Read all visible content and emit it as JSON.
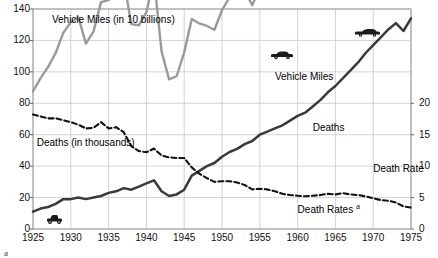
{
  "chart_data": {
    "type": "line",
    "title": "",
    "xlabel": "",
    "ylabel_left": "Deaths (in thousands)",
    "ylabel_right": "",
    "xlim": [
      1925,
      1975
    ],
    "ylim_left": [
      0,
      140
    ],
    "ylim_right": [
      0,
      20
    ],
    "grid": true,
    "legend_position": "inline-annotations",
    "x_ticks": [
      "1925",
      "1930",
      "1935",
      "1940",
      "1945",
      "1950",
      "1955",
      "1960",
      "1965",
      "1970",
      "1975"
    ],
    "y_ticks_left": [
      "0",
      "20",
      "40",
      "60",
      "80",
      "100",
      "120",
      "140"
    ],
    "y_ticks_right": [
      "0",
      "5",
      "10",
      "15",
      "20"
    ],
    "annotations": [
      {
        "text": "Vehicle Miles (in 10 billions)",
        "x": 1927.5,
        "y_left": 133
      },
      {
        "text": "Deaths (in thousands)",
        "x": 1925.5,
        "y_left": 55
      },
      {
        "text": "Vehicle Miles",
        "x": 1957,
        "y_left": 97
      },
      {
        "text": "Deaths",
        "x": 1962,
        "y_left": 64
      },
      {
        "text": "Death Rate",
        "x": 1970,
        "y_left": 38
      },
      {
        "text": "Death Rates",
        "x": 1960,
        "y_left": 14,
        "superscript": "a"
      }
    ],
    "icons": [
      {
        "name": "vintage-car-icon",
        "x": 1928,
        "y_left": 8
      },
      {
        "name": "sedan-car-icon",
        "x": 1958,
        "y_left": 113
      },
      {
        "name": "modern-car-icon",
        "x": 1969,
        "y_left": 127
      }
    ],
    "x": [
      1925,
      1926,
      1927,
      1928,
      1929,
      1930,
      1931,
      1932,
      1933,
      1934,
      1935,
      1936,
      1937,
      1938,
      1939,
      1940,
      1941,
      1942,
      1943,
      1944,
      1945,
      1946,
      1947,
      1948,
      1949,
      1950,
      1951,
      1952,
      1953,
      1954,
      1955,
      1956,
      1957,
      1958,
      1959,
      1960,
      1961,
      1962,
      1963,
      1964,
      1965,
      1966,
      1967,
      1968,
      1969,
      1970,
      1971,
      1972,
      1973,
      1974,
      1975
    ],
    "series": [
      {
        "name": "Vehicle Miles",
        "style": "solid-dark",
        "color": "#3a3a3a",
        "axis": "left",
        "unit": "10 billions",
        "values": [
          11,
          13,
          14,
          16,
          19,
          19,
          20,
          19,
          20,
          21,
          23,
          24,
          26,
          25,
          27,
          29,
          31,
          24,
          21,
          22,
          25,
          34,
          37,
          40,
          42,
          46,
          49,
          51,
          54,
          56,
          60,
          62,
          64,
          66,
          69,
          72,
          74,
          78,
          82,
          87,
          91,
          96,
          101,
          106,
          112,
          117,
          122,
          127,
          131,
          126,
          134
        ]
      },
      {
        "name": "Deaths",
        "style": "solid-gray",
        "color": "#9a9a9a",
        "axis": "right",
        "unit": "thousands",
        "values": [
          21.9,
          24.0,
          25.8,
          28.0,
          31.2,
          32.9,
          33.7,
          29.5,
          31.4,
          36.1,
          36.4,
          38.1,
          39.6,
          32.6,
          32.4,
          34.5,
          39.9,
          28.3,
          23.8,
          24.3,
          28.1,
          33.4,
          32.7,
          32.3,
          31.7,
          34.8,
          36.9,
          37.8,
          37.9,
          35.6,
          38.4,
          39.6,
          38.7,
          37.0,
          37.9,
          38.1,
          38.1,
          40.8,
          43.6,
          47.7,
          49.2,
          53.0,
          53.0,
          55.2,
          56.4,
          54.6,
          54.4,
          56.3,
          55.5,
          46.4,
          45.9
        ]
      },
      {
        "name": "Death Rates",
        "style": "dashed",
        "color": "#111111",
        "axis": "right",
        "unit": "per 100 million vehicle miles",
        "values": [
          18.2,
          17.9,
          17.6,
          17.6,
          17.3,
          17.0,
          16.6,
          16.0,
          16.1,
          17.0,
          16.0,
          16.2,
          15.4,
          13.2,
          12.4,
          12.2,
          12.8,
          11.7,
          11.4,
          11.3,
          11.3,
          9.8,
          8.8,
          8.1,
          7.5,
          7.6,
          7.6,
          7.4,
          7.0,
          6.3,
          6.4,
          6.3,
          6.0,
          5.6,
          5.4,
          5.3,
          5.2,
          5.3,
          5.4,
          5.6,
          5.5,
          5.7,
          5.5,
          5.4,
          5.2,
          4.9,
          4.6,
          4.5,
          4.2,
          3.6,
          3.4
        ]
      }
    ],
    "footnote": {
      "marker": "a",
      "text": ""
    }
  }
}
